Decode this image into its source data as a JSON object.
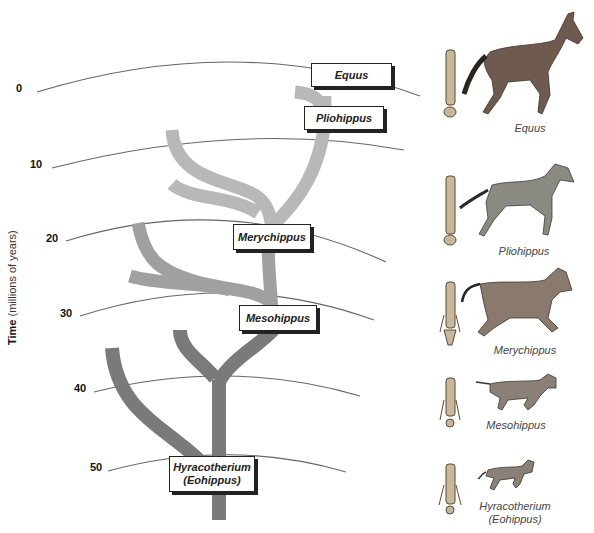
{
  "axis": {
    "title_bold": "Time",
    "title_rest": " (millions of years)",
    "ticks": [
      {
        "label": "0",
        "x": 16,
        "y": 88
      },
      {
        "label": "10",
        "x": 30,
        "y": 164
      },
      {
        "label": "20",
        "x": 46,
        "y": 237
      },
      {
        "label": "30",
        "x": 60,
        "y": 312
      },
      {
        "label": "40",
        "x": 74,
        "y": 388
      },
      {
        "label": "50",
        "x": 90,
        "y": 467
      }
    ]
  },
  "colors": {
    "recent_branch": "#b5b5b5",
    "middle_branch": "#a3a3a3",
    "ancient_branch": "#7a7a7a",
    "arc_line": "#666666",
    "box_border": "#222222"
  },
  "genera": [
    {
      "id": "equus",
      "name": "Equus",
      "time_mya": 0
    },
    {
      "id": "pliohippus",
      "name": "Pliohippus",
      "time_mya": 5
    },
    {
      "id": "merychippus",
      "name": "Merychippus",
      "time_mya": 23
    },
    {
      "id": "mesohippus",
      "name": "Mesohippus",
      "time_mya": 32
    },
    {
      "id": "hyracotherium",
      "name": "Hyracotherium",
      "alt_name": "(Eohippus)",
      "time_mya": 50
    }
  ],
  "captions": [
    {
      "id": "equus",
      "line1": "Equus"
    },
    {
      "id": "pliohippus",
      "line1": "Pliohippus"
    },
    {
      "id": "merychippus",
      "line1": "Merychippus"
    },
    {
      "id": "mesohippus",
      "line1": "Mesohippus"
    },
    {
      "id": "hyracotherium",
      "line1": "Hyracotherium",
      "line2": "(Eohippus)"
    }
  ]
}
